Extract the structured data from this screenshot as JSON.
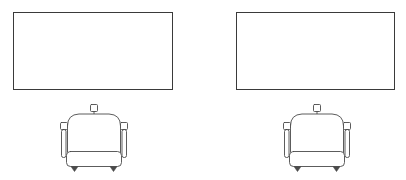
{
  "drawing": {
    "title": "Furniture plan line drawing",
    "background_color": "#ffffff",
    "stroke_color": "#3a3a3a",
    "width": 406,
    "height": 180,
    "groups": [
      {
        "id": "left",
        "label": "Left workstation group",
        "table": {
          "label": "Rectangular table top view",
          "x": 13,
          "y": 12,
          "width": 159,
          "height": 77
        },
        "chair": {
          "label": "Armchair front elevation",
          "x": 59,
          "y": 104,
          "width": 70,
          "height": 68,
          "parts": {
            "knob_label": "top center knob",
            "backrest_label": "rounded backrest",
            "left_arm_label": "left armrest",
            "right_arm_label": "right armrest",
            "seat_label": "seat cushion",
            "feet_label": "tapered feet"
          }
        }
      },
      {
        "id": "right",
        "label": "Right workstation group",
        "table": {
          "label": "Rectangular table top view",
          "x": 236,
          "y": 12,
          "width": 158,
          "height": 77
        },
        "chair": {
          "label": "Armchair front elevation",
          "x": 282,
          "y": 104,
          "width": 70,
          "height": 68,
          "parts": {
            "knob_label": "top center knob",
            "backrest_label": "rounded backrest",
            "left_arm_label": "left armrest",
            "right_arm_label": "right armrest",
            "seat_label": "seat cushion",
            "feet_label": "tapered feet"
          }
        }
      }
    ]
  }
}
